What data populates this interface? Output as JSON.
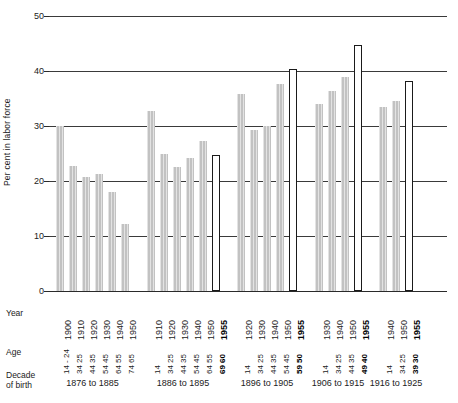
{
  "chart_data": {
    "type": "bar",
    "title": "",
    "xlabel": "",
    "ylabel": "Per cent in labor force",
    "ylim": [
      0,
      50
    ],
    "yticks": [
      0,
      10,
      20,
      30,
      40,
      50
    ],
    "grid": true,
    "legend": "none",
    "row_labels": {
      "year": "Year",
      "age": "Age",
      "decade": "Decade of birth"
    },
    "note_projection": "Open (white outlined) bars are 1955 projections",
    "groups": [
      {
        "decade": "1876 to 1885",
        "points": [
          {
            "year": "1900",
            "age_top": "14 - 24",
            "age_bottom": "",
            "age": "14-24",
            "value": 30.0,
            "style": "filled"
          },
          {
            "year": "1910",
            "age_top": "25",
            "age_bottom": "34",
            "age": "25-34",
            "value": 22.7,
            "style": "filled"
          },
          {
            "year": "1920",
            "age_top": "35",
            "age_bottom": "44",
            "age": "35-44",
            "value": 20.7,
            "style": "filled"
          },
          {
            "year": "1930",
            "age_top": "45",
            "age_bottom": "54",
            "age": "45-54",
            "value": 21.2,
            "style": "filled"
          },
          {
            "year": "1940",
            "age_top": "55",
            "age_bottom": "64",
            "age": "55-64",
            "value": 18.0,
            "style": "filled"
          },
          {
            "year": "1950",
            "age_top": "65",
            "age_bottom": "74",
            "age": "65-74",
            "value": 12.1,
            "style": "filled"
          }
        ]
      },
      {
        "decade": "1886 to 1895",
        "points": [
          {
            "year": "1910",
            "age_top": "14",
            "age_bottom": "",
            "age": "14-24",
            "value": 32.8,
            "style": "filled"
          },
          {
            "year": "1920",
            "age_top": "25",
            "age_bottom": "34",
            "age": "25-34",
            "value": 24.9,
            "style": "filled"
          },
          {
            "year": "1930",
            "age_top": "35",
            "age_bottom": "44",
            "age": "35-44",
            "value": 22.6,
            "style": "filled"
          },
          {
            "year": "1940",
            "age_top": "45",
            "age_bottom": "54",
            "age": "45-54",
            "value": 24.2,
            "style": "filled"
          },
          {
            "year": "1950",
            "age_top": "55",
            "age_bottom": "64",
            "age": "55-64",
            "value": 27.3,
            "style": "filled"
          },
          {
            "year": "1955",
            "age_top": "60",
            "age_bottom": "69",
            "age": "60-69",
            "value": 24.8,
            "style": "open"
          }
        ]
      },
      {
        "decade": "1896 to 1905",
        "points": [
          {
            "year": "1920",
            "age_top": "14",
            "age_bottom": "",
            "age": "14-24",
            "value": 35.9,
            "style": "filled"
          },
          {
            "year": "1930",
            "age_top": "25",
            "age_bottom": "34",
            "age": "25-34",
            "value": 29.3,
            "style": "filled"
          },
          {
            "year": "1940",
            "age_top": "35",
            "age_bottom": "44",
            "age": "35-44",
            "value": 30.0,
            "style": "filled"
          },
          {
            "year": "1950",
            "age_top": "45",
            "age_bottom": "54",
            "age": "45-54",
            "value": 37.7,
            "style": "filled"
          },
          {
            "year": "1955",
            "age_top": "50",
            "age_bottom": "59",
            "age": "50-59",
            "value": 40.3,
            "style": "open"
          }
        ]
      },
      {
        "decade": "1906 to 1915",
        "points": [
          {
            "year": "1930",
            "age_top": "14",
            "age_bottom": "",
            "age": "14-24",
            "value": 34.0,
            "style": "filled"
          },
          {
            "year": "1940",
            "age_top": "25",
            "age_bottom": "34",
            "age": "25-34",
            "value": 36.4,
            "style": "filled"
          },
          {
            "year": "1950",
            "age_top": "35",
            "age_bottom": "44",
            "age": "35-44",
            "value": 38.9,
            "style": "filled"
          },
          {
            "year": "1955",
            "age_top": "40",
            "age_bottom": "49",
            "age": "40-49",
            "value": 44.8,
            "style": "open"
          }
        ]
      },
      {
        "decade": "1916 to 1925",
        "points": [
          {
            "year": "1940",
            "age_top": "14",
            "age_bottom": "",
            "age": "14-24",
            "value": 33.4,
            "style": "filled"
          },
          {
            "year": "1950",
            "age_top": "25",
            "age_bottom": "34",
            "age": "25-34",
            "value": 34.5,
            "style": "filled"
          },
          {
            "year": "1955",
            "age_top": "30",
            "age_bottom": "39",
            "age": "30-39",
            "value": 38.1,
            "style": "open"
          }
        ]
      }
    ]
  }
}
